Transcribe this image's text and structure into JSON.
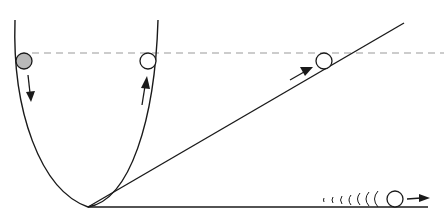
{
  "diagram": {
    "colors": {
      "stroke": "#1a1a1a",
      "reference_line": "#999999",
      "released_ball_fill": "#b8b8b8",
      "ball_fill": "#ffffff"
    },
    "reference_height_y": 53,
    "balls": [
      {
        "id": "released",
        "cx": 24,
        "cy": 61,
        "r": 8,
        "fill": "#b8b8b8",
        "arrow": "down"
      },
      {
        "id": "u-right",
        "cx": 148,
        "cy": 61,
        "r": 8,
        "fill": "#ffffff",
        "arrow": "up"
      },
      {
        "id": "incline",
        "cx": 324,
        "cy": 61,
        "r": 8,
        "fill": "#ffffff",
        "arrow": "up-right"
      },
      {
        "id": "horizontal",
        "cx": 395,
        "cy": 199,
        "r": 8,
        "fill": "#ffffff",
        "arrow": "right"
      }
    ],
    "motion_trail_count": 7
  }
}
